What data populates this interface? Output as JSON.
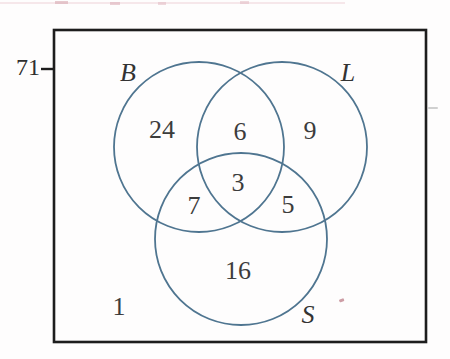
{
  "figure": {
    "kind": "three-set-venn-diagram",
    "universe_total": "71",
    "outside_circles_count": "1",
    "sets": [
      {
        "id": "B",
        "label": "B"
      },
      {
        "id": "L",
        "label": "L"
      },
      {
        "id": "S",
        "label": "S"
      }
    ],
    "regions": {
      "b_only": "24",
      "l_only": "9",
      "s_only": "16",
      "b_and_l": "6",
      "b_and_s": "7",
      "l_and_s": "5",
      "b_and_l_and_s": "3"
    },
    "colors": {
      "circle_stroke": "#4f7590",
      "rectangle_stroke": "#1d1d1d",
      "text": "#3c3c3c"
    }
  }
}
